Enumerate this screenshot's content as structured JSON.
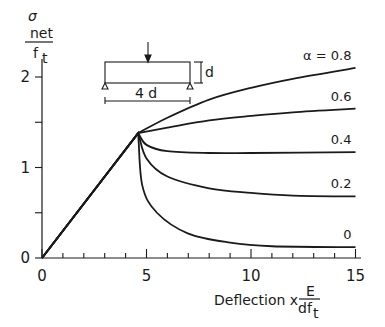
{
  "chart_data": {
    "type": "line",
    "title": "",
    "xlabel": "Deflection x E/(d f_t)",
    "xlabel_parts": {
      "prefix": "Deflection  x",
      "num": "E",
      "den_main": "df",
      "den_sub": "t"
    },
    "ylabel": "σ_net / f_t",
    "ylabel_parts": {
      "sym": "σ",
      "sub": "net",
      "den_main": "f",
      "den_sub": "t"
    },
    "xlim": [
      0,
      15
    ],
    "ylim": [
      0,
      2.3
    ],
    "x_ticks": [
      0,
      5,
      10,
      15
    ],
    "x_minor_step": 1,
    "y_ticks": [
      0,
      1,
      2
    ],
    "y_minor_step": 0.5,
    "grid": false,
    "legend": "inline labels at right end of curves",
    "inset": {
      "description": "Simply supported beam with central point load",
      "depth_label": "d",
      "span_label": "4 d"
    },
    "series": [
      {
        "name": "α = 0.8",
        "label": "α = 0.8",
        "x": [
          0,
          4.6,
          6,
          8,
          10,
          12,
          15
        ],
        "y": [
          0,
          1.38,
          1.55,
          1.75,
          1.88,
          1.98,
          2.1
        ]
      },
      {
        "name": "α = 0.6",
        "label": "0.6",
        "x": [
          0,
          4.6,
          6,
          8,
          10,
          12,
          15
        ],
        "y": [
          0,
          1.38,
          1.44,
          1.52,
          1.57,
          1.61,
          1.65
        ]
      },
      {
        "name": "α = 0.4",
        "label": "0.4",
        "x": [
          0,
          4.6,
          5,
          6,
          8,
          10,
          15
        ],
        "y": [
          0,
          1.38,
          1.25,
          1.18,
          1.16,
          1.16,
          1.17
        ]
      },
      {
        "name": "α = 0.2",
        "label": "0.2",
        "x": [
          0,
          4.6,
          5,
          6,
          8,
          10,
          12,
          15
        ],
        "y": [
          0,
          1.38,
          1.1,
          0.9,
          0.77,
          0.72,
          0.69,
          0.68
        ]
      },
      {
        "name": "α = 0",
        "label": "0",
        "x": [
          0,
          4.6,
          4.8,
          5.5,
          7,
          9,
          11,
          15
        ],
        "y": [
          0,
          1.38,
          0.8,
          0.5,
          0.27,
          0.17,
          0.13,
          0.12
        ]
      }
    ]
  }
}
